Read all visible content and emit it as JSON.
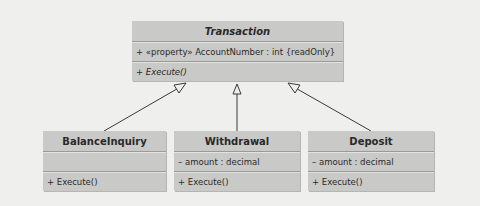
{
  "diagram": {
    "type": "uml-class-diagram",
    "parent": {
      "name": "Transaction",
      "abstract": true,
      "attributes": [
        "+ «property» AccountNumber : int {readOnly}"
      ],
      "operations": [
        "+ Execute()"
      ]
    },
    "children": [
      {
        "name": "BalanceInquiry",
        "attributes": [
          ""
        ],
        "operations": [
          "+ Execute()"
        ]
      },
      {
        "name": "Withdrawal",
        "attributes": [
          "– amount : decimal"
        ],
        "operations": [
          "+ Execute()"
        ]
      },
      {
        "name": "Deposit",
        "attributes": [
          "– amount : decimal"
        ],
        "operations": [
          "+ Execute()"
        ]
      }
    ],
    "relationships": [
      {
        "from": "BalanceInquiry",
        "to": "Transaction",
        "kind": "generalization"
      },
      {
        "from": "Withdrawal",
        "to": "Transaction",
        "kind": "generalization"
      },
      {
        "from": "Deposit",
        "to": "Transaction",
        "kind": "generalization"
      }
    ],
    "colors": {
      "background": "#efefed",
      "class_fill": "#c9c9c7",
      "separator": "#9a9a98",
      "edge": "#3a3a3a"
    }
  }
}
